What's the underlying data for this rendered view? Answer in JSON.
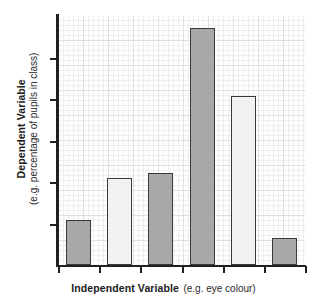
{
  "chart_data": {
    "type": "bar",
    "title": "",
    "subtitle": "",
    "xlabel": "Independent Variable (e.g. eye colour)",
    "ylabel": "Dependent Variable (e.g. percentage of pupils in class)",
    "xlabel_bold": "Independent Variable",
    "xlabel_regular": "(e.g. eye colour)",
    "ylabel_bold": "Dependent Variable",
    "ylabel_regular": "(e.g. percentage of pupils in class)",
    "categories": [
      "1",
      "2",
      "3",
      "4",
      "5",
      "6"
    ],
    "values": [
      18,
      35,
      37,
      95,
      68,
      11
    ],
    "ylim": [
      0,
      100
    ],
    "xlim": [
      0,
      6
    ],
    "grid": true,
    "grid_style": "graph-paper minor 5px / major 25px",
    "legend": "none",
    "y_tick_count": 5,
    "y_tick_labels": [
      "",
      "",
      "",
      "",
      ""
    ],
    "x_tick_labels": [
      "",
      "",
      "",
      "",
      "",
      "",
      ""
    ],
    "bar_colors": [
      "#a8a8a8",
      "#f2f2f0",
      "#a8a8a8",
      "#a8a8a8",
      "#f2f2f0",
      "#a8a8a8"
    ],
    "bar_border_color": "#3a3a3a",
    "axis_color": "#231f20",
    "plot_background": "#fefefe",
    "page_background": "#ffffff",
    "bars": [
      {
        "index": 1,
        "value": 18,
        "color": "#a8a8a8",
        "shade": "dark"
      },
      {
        "index": 2,
        "value": 35,
        "color": "#f2f2f0",
        "shade": "light"
      },
      {
        "index": 3,
        "value": 37,
        "color": "#a8a8a8",
        "shade": "dark"
      },
      {
        "index": 4,
        "value": 95,
        "color": "#a8a8a8",
        "shade": "dark"
      },
      {
        "index": 5,
        "value": 68,
        "color": "#f2f2f0",
        "shade": "light"
      },
      {
        "index": 6,
        "value": 11,
        "color": "#a8a8a8",
        "shade": "dark"
      }
    ]
  },
  "axes": {
    "y": {
      "label_bold": "Dependent Variable",
      "label_regular": "(e.g. percentage of pupils in class)"
    },
    "x": {
      "label_bold": "Independent Variable",
      "label_regular": "(e.g. eye colour)"
    }
  }
}
